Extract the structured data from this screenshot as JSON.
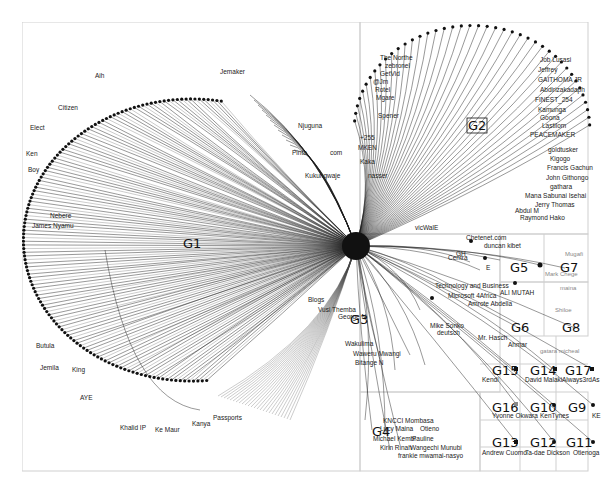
{
  "graph": {
    "type": "network-group-in-a-box",
    "background": "#ffffff",
    "edge_color": "#1a1a1a",
    "box_border_color": "#cfcfcf",
    "groups": [
      {
        "id": "G1",
        "label": "G1"
      },
      {
        "id": "G2",
        "label": "G2"
      },
      {
        "id": "G3",
        "label": "G3"
      },
      {
        "id": "G4",
        "label": "G4"
      },
      {
        "id": "G5",
        "label": "G5"
      },
      {
        "id": "G6",
        "label": "G6"
      },
      {
        "id": "G7",
        "label": "G7"
      },
      {
        "id": "G8",
        "label": "G8"
      },
      {
        "id": "G9",
        "label": "G9"
      },
      {
        "id": "G10",
        "label": "G10"
      },
      {
        "id": "G11",
        "label": "G11"
      },
      {
        "id": "G12",
        "label": "G12"
      },
      {
        "id": "G13",
        "label": "G13"
      },
      {
        "id": "G14",
        "label": "G14"
      },
      {
        "id": "G15",
        "label": "G15"
      },
      {
        "id": "G16",
        "label": "G16"
      },
      {
        "id": "G17",
        "label": "G17"
      }
    ],
    "node_labels": {
      "g1": [
        "Aih",
        "Jemaker",
        "Citizen",
        "Elect",
        "Ken",
        "Boy",
        "James Nyamu",
        "Nebere",
        "Butula",
        "Jemila",
        "King",
        "AYE",
        "Khalid IP",
        "Ke Maur",
        "Kanya",
        "Passports",
        "Pinta",
        "com",
        "Kukungwaje",
        "Njuguna"
      ],
      "g2": [
        "The Northe",
        "zebronel",
        "GetVid",
        "@Jm",
        "Rotel",
        "Mgare",
        "Spener",
        "+255",
        "MKEN",
        "Kaka",
        "nasser",
        "Job Lusasi",
        "Jeffrey",
        "GAITHOMA JR",
        "Abdirizakadaph",
        "FINEST_254",
        "Kamunga",
        "Goona",
        "Lastilom",
        "PEACEMAKER",
        "goldtusker",
        "Kigogo",
        "Francis Gachun",
        "John Githongo",
        "gathara",
        "Mana Sabunai Isehai",
        "Jerry Thomas",
        "Abdul M",
        "Raymond Hako",
        "vicWalE"
      ],
      "g3": [
        "Chetenet.com",
        "duncan kibet",
        "Microsoft 4Africa",
        "Technology and Business",
        "Amrote Abdella",
        "Blogs",
        "Vusi Themba",
        "Wakulima",
        "Waweru Mwangi",
        "Bitange N",
        "Mike Sonko",
        "deutsch",
        "George N"
      ],
      "g4": [
        "KNCCI Mombasa",
        "Lucy Maina",
        "Otieno",
        "Michael Kembi",
        "Pauline",
        "Kirin Rinah",
        "Wangechi Munubi",
        "frankie mwamai-nasyo"
      ],
      "g5": [
        "Centra",
        "E",
        "GH"
      ],
      "g6": [
        "ALI MUTAH",
        "Mr. Hasch",
        "Ahmar"
      ],
      "g7": [
        "Mugafi",
        "Mark Chege",
        "maina"
      ],
      "g8": [
        "Shiloe",
        "gatara micheal"
      ],
      "g9": [
        "KE"
      ],
      "g10": [
        "KenTynes"
      ],
      "g11": [
        "Otienoga"
      ],
      "g12": [
        "Ta-dae Dickson"
      ],
      "g13": [
        "Andrew Cuomo"
      ],
      "g14": [
        "David Malaki"
      ],
      "g15": [
        "Kendi"
      ],
      "g16": [
        "Yvonne Okwara"
      ],
      "g17": [
        "Always3rdAs"
      ]
    }
  }
}
